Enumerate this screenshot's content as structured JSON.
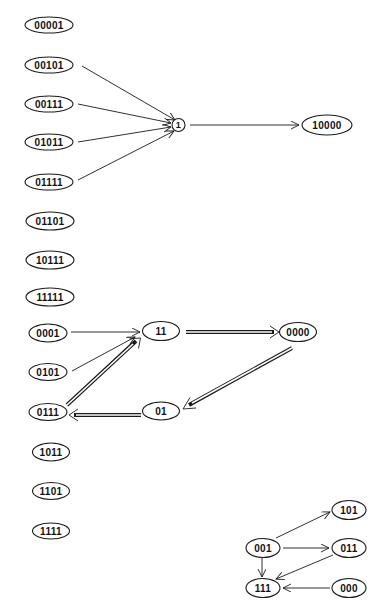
{
  "diagram": {
    "group1": {
      "isolated_nodes": [
        "00001",
        "01101",
        "10111",
        "11111"
      ],
      "sources": [
        "00101",
        "00111",
        "01011",
        "01111"
      ],
      "hub": "1",
      "target": "10000",
      "edges": [
        {
          "from": "00101",
          "to": "1",
          "style": "single"
        },
        {
          "from": "00111",
          "to": "1",
          "style": "single"
        },
        {
          "from": "01011",
          "to": "1",
          "style": "single"
        },
        {
          "from": "01111",
          "to": "1",
          "style": "single"
        },
        {
          "from": "1",
          "to": "10000",
          "style": "single"
        }
      ]
    },
    "group2": {
      "nodes": [
        "0001",
        "0101",
        "0111",
        "11",
        "0000",
        "01"
      ],
      "isolated_nodes": [
        "1011",
        "1101",
        "1111"
      ],
      "edges": [
        {
          "from": "0001",
          "to": "11",
          "style": "single"
        },
        {
          "from": "0101",
          "to": "11",
          "style": "single"
        },
        {
          "from": "0111",
          "to": "11",
          "style": "double"
        },
        {
          "from": "11",
          "to": "0000",
          "style": "double"
        },
        {
          "from": "0000",
          "to": "01",
          "style": "double"
        },
        {
          "from": "01",
          "to": "0111",
          "style": "double"
        }
      ]
    },
    "group3": {
      "nodes": [
        "101",
        "001",
        "011",
        "111",
        "000"
      ],
      "edges": [
        {
          "from": "001",
          "to": "101",
          "style": "single"
        },
        {
          "from": "001",
          "to": "011",
          "style": "single"
        },
        {
          "from": "001",
          "to": "111",
          "style": "single"
        },
        {
          "from": "011",
          "to": "111",
          "style": "single"
        },
        {
          "from": "000",
          "to": "111",
          "style": "single"
        }
      ]
    }
  },
  "labels": {
    "n00001": "00001",
    "n00101": "00101",
    "n00111": "00111",
    "n01011": "01011",
    "n01111": "01111",
    "n01101": "01101",
    "n10111": "10111",
    "n11111": "11111",
    "hub1": "1",
    "n10000": "10000",
    "n0001": "0001",
    "n0101": "0101",
    "n0111": "0111",
    "n1011": "1011",
    "n1101": "1101",
    "n1111": "1111",
    "n11": "11",
    "n0000": "0000",
    "n01": "01",
    "n101": "101",
    "n001": "001",
    "n011": "011",
    "n111": "111",
    "n000": "000"
  }
}
